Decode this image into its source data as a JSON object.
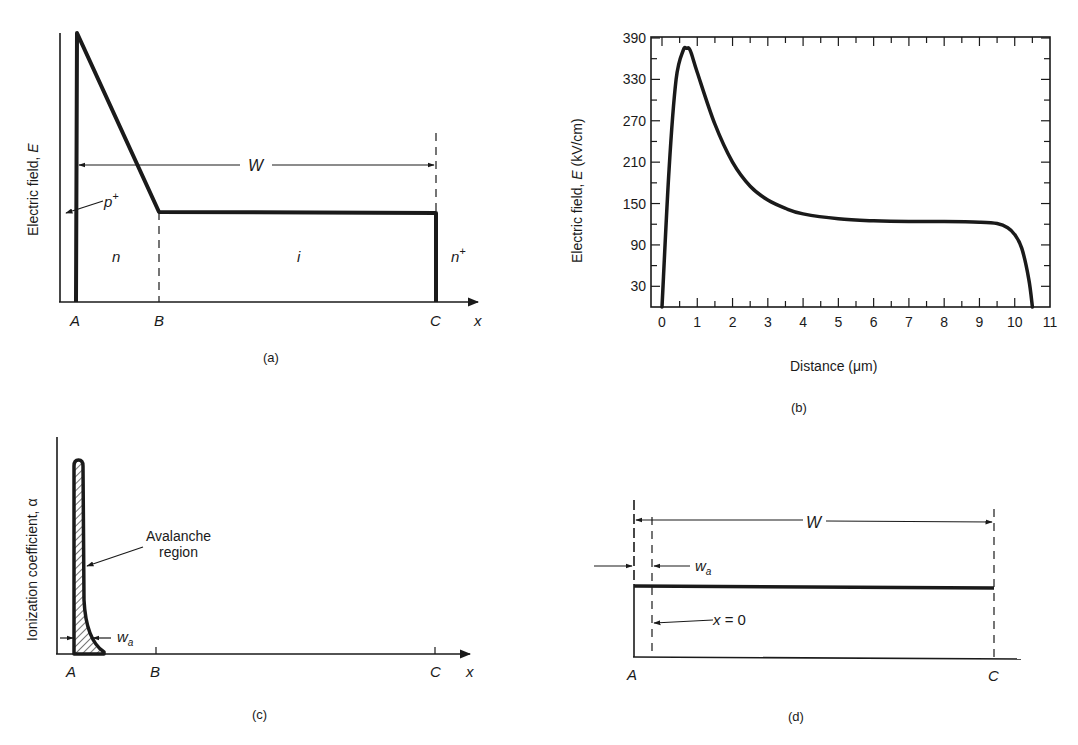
{
  "panels": {
    "a": {
      "caption": "(a)",
      "ylabel": "Electric field, ",
      "ylabel_var": "E",
      "points": [
        "A",
        "B",
        "C"
      ],
      "xaxis_label": "x",
      "regions": [
        "n",
        "i",
        "n"
      ],
      "region_superscripts": {
        "n_plus": "+",
        "p_plus": "+"
      },
      "p_label": "p",
      "width_label": "W"
    },
    "b": {
      "caption": "(b)",
      "ylabel_prefix": "Electric field, ",
      "ylabel_var": "E",
      "ylabel_unit": " (kV/cm)",
      "xlabel": "Distance (μm)",
      "yticks": [
        "390",
        "330",
        "270",
        "210",
        "150",
        "90",
        "30"
      ],
      "xticks": [
        "0",
        "1",
        "2",
        "3",
        "4",
        "5",
        "6",
        "7",
        "8",
        "9",
        "10",
        "11"
      ]
    },
    "c": {
      "caption": "(c)",
      "ylabel": "Ionization coefficient, α",
      "annotation_line1": "Avalanche",
      "annotation_line2": "region",
      "wa_label": "w",
      "wa_sub": "a",
      "points": [
        "A",
        "B",
        "C"
      ],
      "xaxis_label": "x"
    },
    "d": {
      "caption": "(d)",
      "width_label": "W",
      "wa_label": "w",
      "wa_sub": "a",
      "origin_label": "x = 0",
      "points": [
        "A",
        "C"
      ]
    }
  },
  "chart_data": [
    {
      "type": "line",
      "title": "(a) Electric field profile of Read diode (schematic)",
      "xlabel": "x",
      "ylabel": "Electric field, E",
      "x": [
        "A",
        "A",
        "B",
        "C",
        "C"
      ],
      "series": [
        {
          "name": "E(x)",
          "values": [
            0,
            1.0,
            0.33,
            0.33,
            0
          ]
        }
      ],
      "annotations": [
        "p+",
        "n",
        "i",
        "n+",
        "W"
      ],
      "grid": false
    },
    {
      "type": "line",
      "title": "(b)",
      "xlabel": "Distance (μm)",
      "ylabel": "Electric field, E (kV/cm)",
      "xlim": [
        0,
        11
      ],
      "ylim": [
        0,
        390
      ],
      "xticks": [
        0,
        1,
        2,
        3,
        4,
        5,
        6,
        7,
        8,
        9,
        10,
        11
      ],
      "yticks": [
        30,
        90,
        150,
        210,
        270,
        330,
        390
      ],
      "x": [
        0.0,
        0.2,
        0.4,
        0.6,
        0.7,
        0.8,
        1.0,
        1.5,
        2.0,
        2.5,
        3.0,
        3.5,
        4.0,
        5.0,
        6.0,
        7.0,
        8.0,
        9.0,
        9.5,
        9.8,
        10.0,
        10.2,
        10.4,
        10.5
      ],
      "series": [
        {
          "name": "E",
          "values": [
            0,
            200,
            330,
            372,
            375,
            372,
            340,
            265,
            210,
            175,
            155,
            143,
            135,
            128,
            125,
            124,
            124,
            123,
            121,
            115,
            105,
            85,
            40,
            0
          ]
        }
      ],
      "grid": false
    },
    {
      "type": "area",
      "title": "(c) Ionization coefficient (schematic)",
      "xlabel": "x",
      "ylabel": "Ionization coefficient, α",
      "x": [
        "A",
        "A",
        "A+w_a",
        "B",
        "C"
      ],
      "series": [
        {
          "name": "α",
          "values": [
            0,
            1.0,
            0.05,
            0,
            0
          ]
        }
      ],
      "annotations": [
        "Avalanche region",
        "w_a"
      ],
      "grid": false
    },
    {
      "type": "line",
      "title": "(d) Simplified field model (schematic)",
      "x": [
        "A",
        "C"
      ],
      "series": [
        {
          "name": "E",
          "values": [
            0.6,
            0.6
          ]
        }
      ],
      "annotations": [
        "W",
        "w_a",
        "x = 0"
      ],
      "grid": false
    }
  ]
}
